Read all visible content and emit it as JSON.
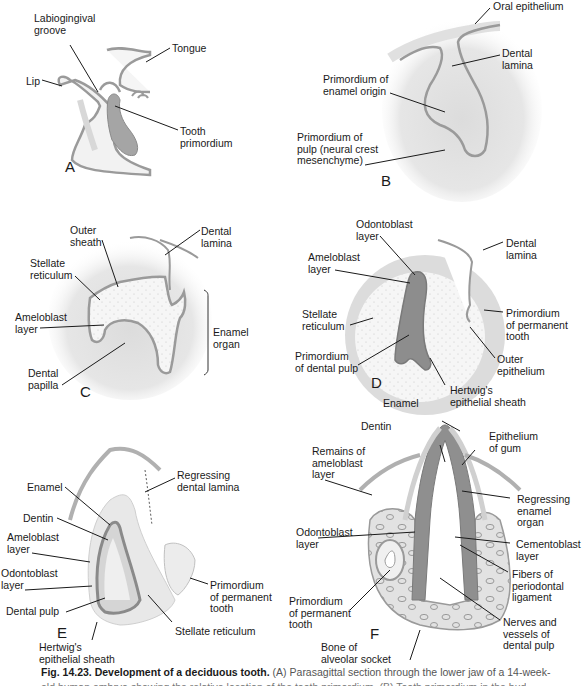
{
  "figure": {
    "panels": {
      "A": {
        "letter": "A",
        "labels": {
          "labiogingival_groove": "Labiogingival\ngroove",
          "tongue": "Tongue",
          "lip": "Lip",
          "tooth_primordium": "Tooth\nprimordium"
        }
      },
      "B": {
        "letter": "B",
        "labels": {
          "oral_epithelium": "Oral epithelium",
          "dental_lamina": "Dental\nlamina",
          "primordium_enamel": "Primordium of\nenamel origin",
          "primordium_pulp": "Primordium of\npulp (neural crest\nmesenchyme)"
        }
      },
      "C": {
        "letter": "C",
        "labels": {
          "outer_sheath": "Outer\nsheath",
          "dental_lamina": "Dental\nlamina",
          "stellate_reticulum": "Stellate\nreticulum",
          "ameloblast_layer": "Ameloblast\nlayer",
          "enamel_organ": "Enamel\norgan",
          "dental_papilla": "Dental\npapilla"
        }
      },
      "D": {
        "letter": "D",
        "labels": {
          "odontoblast_layer": "Odontoblast\nlayer",
          "dental_lamina": "Dental\nlamina",
          "ameloblast_layer": "Ameloblast\nlayer",
          "stellate_reticulum": "Stellate\nreticulum",
          "primordium_permanent": "Primordium\nof permanent\ntooth",
          "primordium_dental_pulp": "Primordium\nof dental pulp",
          "outer_epithelium": "Outer\nepithelium",
          "hertwig_sheath": "Hertwig's\nepithelial sheath"
        }
      },
      "E": {
        "letter": "E",
        "labels": {
          "regressing_lamina": "Regressing\ndental lamina",
          "enamel": "Enamel",
          "dentin": "Dentin",
          "ameloblast_layer": "Ameloblast\nlayer",
          "odontoblast_layer": "Odontoblast\nlayer",
          "primordium_permanent": "Primordium\nof permanent\ntooth",
          "dental_pulp": "Dental pulp",
          "stellate_reticulum": "Stellate reticulum",
          "hertwig_sheath": "Hertwig's\nepithelial sheath"
        }
      },
      "F": {
        "letter": "F",
        "labels": {
          "enamel": "Enamel",
          "dentin": "Dentin",
          "epithelium_gum": "Epithelium\nof gum",
          "remains_ameloblast": "Remains of\nameloblast\nlayer",
          "regressing_enamel_organ": "Regressing\nenamel\norgan",
          "odontoblast_layer": "Odontoblast\nlayer",
          "cementoblast_layer": "Cementoblast\nlayer",
          "fibers_pdl": "Fibers of\nperiodontal\nligament",
          "primordium_permanent": "Primordium\nof permanent\ntooth",
          "nerves_vessels": "Nerves and\nvessels of\ndental pulp",
          "bone_alveolar": "Bone of\nalveolar socket"
        }
      }
    },
    "caption": {
      "bold": "Fig. 14.23. Development of a deciduous tooth.",
      "text": " (A) Parasagittal section through the lower jaw of a 14-week-",
      "line2": "old human embryo showing the relative location of the tooth primordium. (B) Tooth primordium in the bud"
    }
  },
  "colors": {
    "epithelium": "#9a9a9a",
    "mesenchyme": "#e6e6e6",
    "pulp_dark": "#8c8c8c",
    "stellate": "#f4f4f4",
    "leader": "#1a1a1a"
  }
}
